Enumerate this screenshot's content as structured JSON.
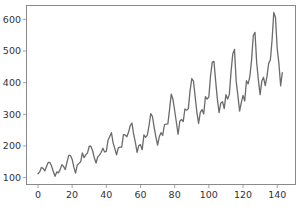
{
  "chart_data": {
    "type": "line",
    "title": "",
    "xlabel": "",
    "ylabel": "",
    "xlim": [
      -7,
      151
    ],
    "ylim": [
      76.6,
      645.4
    ],
    "grid": false,
    "legend": null,
    "x_ticks": [
      0,
      20,
      40,
      60,
      80,
      100,
      120,
      140
    ],
    "y_ticks": [
      100,
      200,
      300,
      400,
      500,
      600
    ],
    "series": [
      {
        "name": "passengers",
        "color": "#6b6b6b",
        "x_start": 0,
        "values": [
          112,
          118,
          132,
          129,
          121,
          135,
          148,
          148,
          136,
          119,
          104,
          118,
          115,
          126,
          141,
          135,
          125,
          149,
          170,
          170,
          158,
          133,
          114,
          140,
          145,
          150,
          178,
          163,
          172,
          178,
          199,
          199,
          184,
          162,
          146,
          166,
          171,
          180,
          193,
          181,
          183,
          218,
          230,
          242,
          209,
          191,
          172,
          194,
          196,
          196,
          236,
          235,
          229,
          243,
          264,
          272,
          237,
          211,
          180,
          201,
          204,
          188,
          235,
          227,
          234,
          264,
          302,
          293,
          259,
          229,
          203,
          229,
          242,
          233,
          267,
          269,
          270,
          315,
          364,
          347,
          312,
          274,
          237,
          278,
          284,
          277,
          317,
          313,
          318,
          374,
          413,
          405,
          355,
          306,
          271,
          306,
          315,
          301,
          356,
          348,
          355,
          422,
          465,
          467,
          404,
          347,
          305,
          336,
          340,
          318,
          362,
          348,
          363,
          435,
          491,
          505,
          404,
          359,
          310,
          337,
          360,
          342,
          406,
          396,
          420,
          472,
          548,
          559,
          463,
          407,
          362,
          405,
          417,
          391,
          419,
          461,
          472,
          535,
          622,
          606,
          508,
          461,
          390,
          432
        ]
      }
    ]
  },
  "plot": {
    "left": 26,
    "top": 5,
    "right": 296,
    "bottom": 185,
    "spine_color": "#8a8a8a",
    "line_width": 1.3
  }
}
